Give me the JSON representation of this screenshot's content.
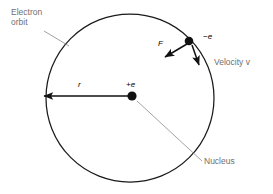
{
  "diagram": {
    "colors": {
      "stroke": "#1a1a1a",
      "label_gray": "#6f6f6f",
      "label_black": "#000000",
      "background": "#ffffff"
    },
    "orbit": {
      "center_x": 130,
      "center_y": 98,
      "radius": 84
    },
    "labels": {
      "electron_orbit": "Electron\norbit",
      "nucleus": "Nucleus",
      "velocity": "Velocity v",
      "velocity_symbol": "v",
      "electron_charge": "−e",
      "nucleus_charge": "+e",
      "radius_symbol": "r",
      "force_symbol": "F"
    },
    "elements": {
      "nucleus_point": {
        "x": 132,
        "y": 96
      },
      "electron_point": {
        "x": 189,
        "y": 41
      },
      "radius_arrow_tip": {
        "x": 40,
        "y": 96
      },
      "force_arrow_tip": {
        "x": 162,
        "y": 60
      },
      "velocity_arrow_tip": {
        "x": 201,
        "y": 68
      }
    }
  }
}
